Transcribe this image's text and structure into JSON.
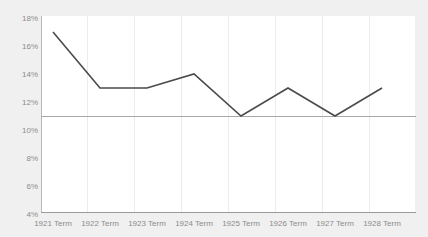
{
  "chart_data": {
    "type": "line",
    "title": "",
    "subtitle": "",
    "xlabel": "",
    "ylabel": "",
    "categories": [
      "1921 Term",
      "1922 Term",
      "1923 Term",
      "1924 Term",
      "1925 Term",
      "1926 Term",
      "1927 Term",
      "1928 Term"
    ],
    "values": [
      17,
      13,
      13,
      14,
      11,
      13,
      11,
      13
    ],
    "value_suffix": "%",
    "ylim": [
      4,
      18
    ],
    "ytick_labels": [
      "18%",
      "16%",
      "14%",
      "12%",
      "10%",
      "8%",
      "6%",
      "4%"
    ],
    "ytick_values": [
      18,
      16,
      14,
      12,
      10,
      8,
      6,
      4
    ],
    "grid": {
      "vertical": true,
      "horizontal": false
    },
    "legend": {
      "visible": false,
      "position": "none",
      "entries": []
    },
    "reference_line": {
      "value": 11,
      "color": "#a8a8a8"
    },
    "series": [
      {
        "name": "",
        "values": [
          17,
          13,
          13,
          14,
          11,
          13,
          11,
          13
        ],
        "color": "#4a4a4a"
      }
    ]
  },
  "style": {
    "background_color": "#f0f0f0",
    "plot_background_color": "#ffffff",
    "line_color": "#4a4a4a",
    "gridline_color": "#ececec",
    "axis_color": "#9a9a9a",
    "tick_label_color": "#8c8c8c"
  }
}
